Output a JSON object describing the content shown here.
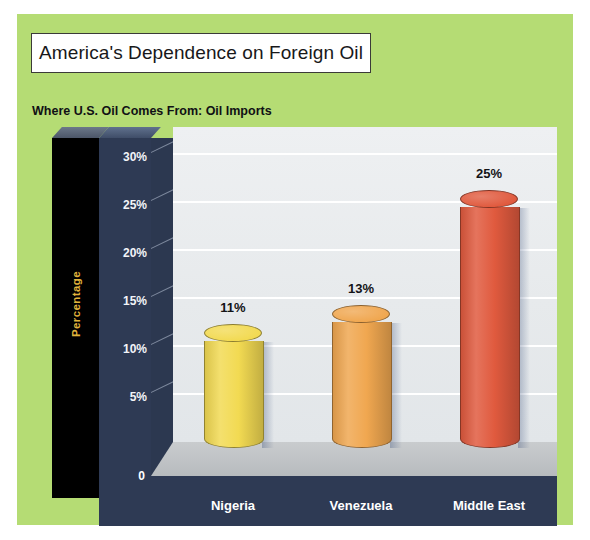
{
  "poster": {
    "background_color": "#b5dc74",
    "title": "America's Dependence on Foreign Oil",
    "subtitle": "Where U.S. Oil Comes From: Oil Imports"
  },
  "chart_data": {
    "type": "bar",
    "title": "Where U.S. Oil Comes From: Oil Imports",
    "categories": [
      "Nigeria",
      "Venezuela",
      "Middle East"
    ],
    "values": [
      11,
      13,
      25
    ],
    "data_labels": [
      "11%",
      "13%",
      "25%"
    ],
    "series": [
      {
        "name": "Oil Imports",
        "values": [
          11,
          13,
          25
        ]
      }
    ],
    "xlabel": "",
    "ylabel": "Percentage",
    "ylim": [
      0,
      32
    ],
    "yticks": [
      0,
      5,
      10,
      15,
      20,
      25,
      30
    ],
    "ytick_labels": [
      "0",
      "5%",
      "10%",
      "15%",
      "20%",
      "25%",
      "30%"
    ],
    "grid": true,
    "legend": false,
    "bar_colors": [
      "#f2da52",
      "#f0a750",
      "#e05a3e"
    ],
    "style": "3d-cylinder"
  },
  "axis": {
    "y_label": "Percentage",
    "y_label_color": "#e0b43c",
    "zero_label": "0",
    "wall_color": "#2e3a54",
    "pillar_color": "#000000"
  },
  "plot": {
    "background_color": "#e9ecee",
    "gridline_color": "#ffffff",
    "floor_color": "#c3c7ca"
  }
}
